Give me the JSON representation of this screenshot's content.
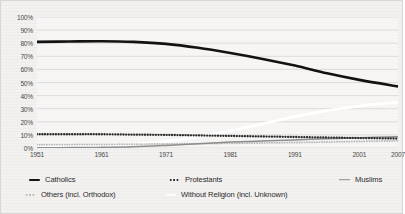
{
  "chart_data": {
    "type": "line",
    "title": "",
    "subtitle": "",
    "xlabel": "",
    "ylabel": "",
    "xlim": [
      1951,
      2007
    ],
    "ylim": [
      0,
      100
    ],
    "grid": true,
    "legend_position": "bottom",
    "x_tick_labels": [
      "1951",
      "1961",
      "1971",
      "1981",
      "1991",
      "2001",
      "2007"
    ],
    "x_tick_values": [
      1951,
      1961,
      1971,
      1981,
      1991,
      2001,
      2007
    ],
    "y_tick_labels": [
      "100%",
      "90%",
      "80%",
      "70%",
      "60%",
      "50%",
      "40%",
      "30%",
      "20%",
      "10%",
      "0%"
    ],
    "y_tick_values": [
      100,
      90,
      80,
      70,
      60,
      50,
      40,
      30,
      20,
      10,
      0
    ],
    "x": [
      1951,
      1956,
      1961,
      1966,
      1971,
      1976,
      1981,
      1986,
      1991,
      1996,
      2001,
      2007
    ],
    "series": [
      {
        "name": "Catholics",
        "label": "Catholics",
        "color": "#121212",
        "style": "solid",
        "marker": "solid-thick",
        "values": [
          81,
          81.3,
          81.5,
          81,
          79.5,
          76.5,
          72.5,
          68,
          63,
          57,
          52,
          47
        ]
      },
      {
        "name": "Protestants",
        "label": "Protestants",
        "color": "#2c2c2c",
        "style": "dotted",
        "marker": "dots-dark",
        "values": [
          10.5,
          10.5,
          10.5,
          10.2,
          10,
          9.6,
          9.2,
          8.8,
          8.4,
          8,
          7.6,
          7.2
        ]
      },
      {
        "name": "Muslims",
        "label": "Muslims",
        "color": "#8d8d8d",
        "style": "solid",
        "marker": "solid-thin",
        "values": [
          0.2,
          0.3,
          0.5,
          1,
          2,
          3.2,
          4.5,
          5.4,
          6.2,
          7,
          7.8,
          8.6
        ]
      },
      {
        "name": "Others (incl. Orthodox)",
        "label": "Others (incl. Orthodox)",
        "color": "#b9b9b9",
        "style": "dotted",
        "marker": "dots-light",
        "values": [
          2.5,
          2.6,
          2.7,
          2.9,
          3.1,
          3.3,
          3.6,
          3.9,
          4.2,
          4.6,
          5,
          5.5
        ]
      },
      {
        "name": "Without Religion (incl. Unknown)",
        "label": "Without Religion (incl. Unknown)",
        "color": "#ffffff",
        "style": "solid",
        "marker": "white-band",
        "values": [
          1.3,
          1.5,
          2,
          3,
          5,
          8.5,
          13,
          18.5,
          24,
          28.5,
          32,
          35
        ]
      }
    ]
  },
  "legend": {
    "items": [
      {
        "label": "Catholics",
        "marker": "solid-thick",
        "color": "#121212"
      },
      {
        "label": "Protestants",
        "marker": "dots-dark",
        "color": "#2c2c2c"
      },
      {
        "label": "Muslims",
        "marker": "solid-thin",
        "color": "#8d8d8d"
      },
      {
        "label": "Others (incl. Orthodox)",
        "marker": "dots-light",
        "color": "#b9b9b9"
      },
      {
        "label": "Without Religion (incl. Unknown)",
        "marker": "white-band",
        "color": "#ffffff"
      }
    ]
  }
}
